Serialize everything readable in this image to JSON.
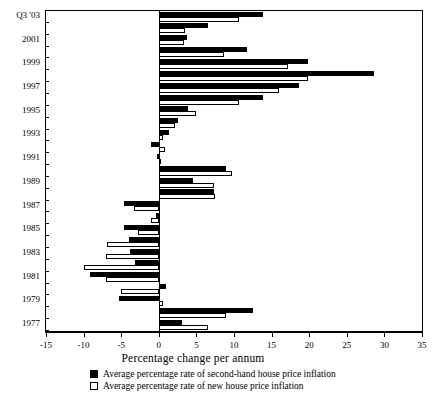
{
  "chart_data": {
    "type": "bar",
    "orientation": "horizontal",
    "title": "",
    "xlabel": "Percentage change per annum",
    "ylabel": "",
    "xlim": [
      -15,
      35
    ],
    "xticks": [
      -15,
      -10,
      -5,
      0,
      5,
      10,
      15,
      20,
      25,
      30,
      35
    ],
    "grid": false,
    "legend_position": "bottom",
    "categories": [
      "1977",
      "1978",
      "1979",
      "1980",
      "1981",
      "1982",
      "1983",
      "1984",
      "1985",
      "1986",
      "1987",
      "1988",
      "1989",
      "1990",
      "1991",
      "1992",
      "1993",
      "1994",
      "1995",
      "1996",
      "1997",
      "1998",
      "1999",
      "2000",
      "2001",
      "2002",
      "Q3 '03"
    ],
    "ylabels_shown": [
      "1977",
      "1979",
      "1981",
      "1983",
      "1985",
      "1987",
      "1989",
      "1991",
      "1993",
      "1995",
      "1997",
      "1999",
      "2001",
      "Q3 '03"
    ],
    "series": [
      {
        "name": "Average percentage rate of second-hand house price inflation",
        "color": "#000000",
        "values": [
          3.1,
          12.5,
          -5.3,
          0.9,
          -9.2,
          -3.1,
          -3.8,
          -4.0,
          -4.6,
          -0.4,
          -4.6,
          7.3,
          4.6,
          9.0,
          -0.3,
          -1.0,
          1.3,
          2.6,
          3.9,
          13.9,
          18.6,
          28.6,
          19.8,
          11.7,
          3.7,
          6.5,
          13.9
        ]
      },
      {
        "name": "Average percentage rate of new house price inflation",
        "color": "#ffffff",
        "values": [
          6.5,
          9.0,
          0.6,
          -5.0,
          -7.0,
          -9.9,
          -7.0,
          -6.9,
          -2.8,
          -1.0,
          -3.3,
          7.5,
          7.3,
          9.7,
          0.2,
          0.8,
          0.5,
          2.2,
          4.9,
          10.6,
          16.0,
          19.8,
          17.2,
          8.7,
          3.4,
          3.5,
          10.6
        ]
      }
    ]
  },
  "axis": {
    "x_title": "Percentage change per annum"
  },
  "legend": {
    "items": [
      {
        "label": "Average percentage rate of second-hand house price inflation",
        "swatch": "black"
      },
      {
        "label": "Average percentage rate of new house price inflation",
        "swatch": "white"
      }
    ]
  }
}
